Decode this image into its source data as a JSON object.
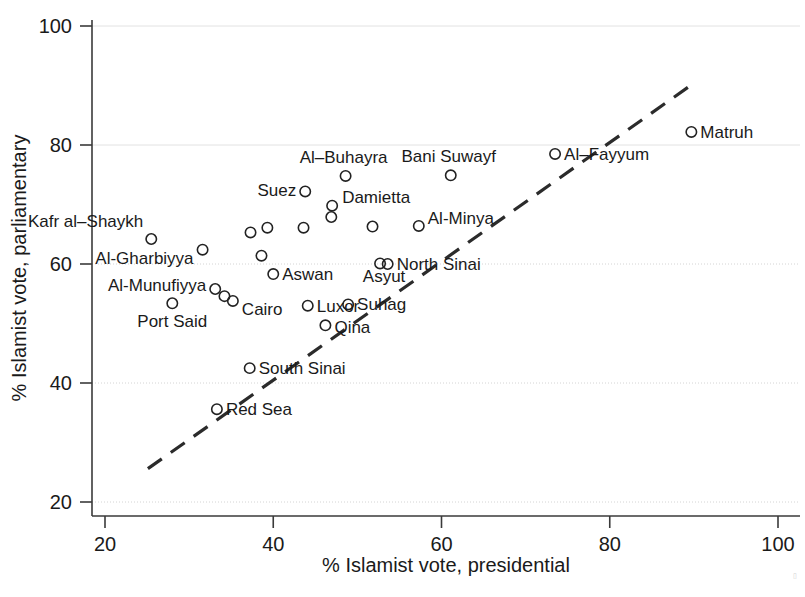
{
  "chart_data": {
    "type": "scatter",
    "title": "",
    "xlabel": "% Islamist vote, presidential",
    "ylabel": "% Islamist vote, parliamentary",
    "xlim": [
      17,
      103
    ],
    "ylim": [
      17.5,
      103
    ],
    "xticks": [
      20,
      40,
      60,
      80,
      100
    ],
    "yticks": [
      20,
      40,
      60,
      80,
      100
    ],
    "xtick_labels": [
      "20",
      "40",
      "60",
      "80",
      "100"
    ],
    "ytick_labels": [
      "20",
      "40",
      "60",
      "80",
      "100"
    ],
    "grid": "horizontal dotted gridlines at each y tick",
    "legend": "none",
    "points": [
      {
        "label": "Kafr al–Shaykh",
        "x": 25.5,
        "y": 64.2,
        "label_dx": -8,
        "label_dy": -12,
        "label_anchor": "end"
      },
      {
        "label": "Port Said",
        "x": 28.0,
        "y": 53.4,
        "label_dx": 0,
        "label_dy": 24,
        "label_anchor": "middle"
      },
      {
        "label": "Al-Gharbiyya",
        "x": 31.6,
        "y": 62.4,
        "label_dx": -9,
        "label_dy": 14,
        "label_anchor": "end"
      },
      {
        "label": "Al-Munufiyya",
        "x": 33.1,
        "y": 55.8,
        "label_dx": -9,
        "label_dy": 2,
        "label_anchor": "end"
      },
      {
        "label": "",
        "x": 34.2,
        "y": 54.6,
        "label_dx": 0,
        "label_dy": 0,
        "label_anchor": "start"
      },
      {
        "label": "Cairo",
        "x": 35.2,
        "y": 53.8,
        "label_dx": 9,
        "label_dy": 14,
        "label_anchor": "start"
      },
      {
        "label": "Red Sea",
        "x": 33.3,
        "y": 35.6,
        "label_dx": 9,
        "label_dy": 6,
        "label_anchor": "start"
      },
      {
        "label": "South Sinai",
        "x": 37.2,
        "y": 42.5,
        "label_dx": 9,
        "label_dy": 6,
        "label_anchor": "start"
      },
      {
        "label": "",
        "x": 37.3,
        "y": 65.3,
        "label_dx": 0,
        "label_dy": 0,
        "label_anchor": "start"
      },
      {
        "label": "",
        "x": 38.6,
        "y": 61.4,
        "label_dx": 0,
        "label_dy": 0,
        "label_anchor": "start"
      },
      {
        "label": "",
        "x": 39.3,
        "y": 66.1,
        "label_dx": 0,
        "label_dy": 0,
        "label_anchor": "start"
      },
      {
        "label": "Aswan",
        "x": 40.0,
        "y": 58.3,
        "label_dx": 9,
        "label_dy": 6,
        "label_anchor": "start"
      },
      {
        "label": "Suez",
        "x": 43.8,
        "y": 72.2,
        "label_dx": -9,
        "label_dy": 5,
        "label_anchor": "end"
      },
      {
        "label": "",
        "x": 43.6,
        "y": 66.1,
        "label_dx": 0,
        "label_dy": 0,
        "label_anchor": "start"
      },
      {
        "label": "Luxor",
        "x": 44.1,
        "y": 53.0,
        "label_dx": 9,
        "label_dy": 6,
        "label_anchor": "start"
      },
      {
        "label": "Qina",
        "x": 46.2,
        "y": 49.7,
        "label_dx": 9,
        "label_dy": 8,
        "label_anchor": "start"
      },
      {
        "label": "Damietta",
        "x": 47.0,
        "y": 69.8,
        "label_dx": 10,
        "label_dy": -3,
        "label_anchor": "start"
      },
      {
        "label": "",
        "x": 46.9,
        "y": 67.9,
        "label_dx": 0,
        "label_dy": 0,
        "label_anchor": "start"
      },
      {
        "label": "Al–Buhayra",
        "x": 48.6,
        "y": 74.8,
        "label_dx": -2,
        "label_dy": -13,
        "label_anchor": "middle"
      },
      {
        "label": "Suhag",
        "x": 48.9,
        "y": 53.2,
        "label_dx": 9,
        "label_dy": 6,
        "label_anchor": "start"
      },
      {
        "label": "",
        "x": 51.8,
        "y": 66.3,
        "label_dx": 0,
        "label_dy": 0,
        "label_anchor": "start"
      },
      {
        "label": "Asyut",
        "x": 52.7,
        "y": 60.1,
        "label_dx": 4,
        "label_dy": 19,
        "label_anchor": "middle"
      },
      {
        "label": "North Sinai",
        "x": 53.6,
        "y": 60.0,
        "label_dx": 9,
        "label_dy": 6,
        "label_anchor": "start"
      },
      {
        "label": "Al-Minya",
        "x": 57.3,
        "y": 66.4,
        "label_dx": 9,
        "label_dy": -2,
        "label_anchor": "start"
      },
      {
        "label": "Bani Suwayf",
        "x": 61.1,
        "y": 74.9,
        "label_dx": -2,
        "label_dy": -13,
        "label_anchor": "middle"
      },
      {
        "label": "Al–Fayyum",
        "x": 73.5,
        "y": 78.5,
        "label_dx": 9,
        "label_dy": 6,
        "label_anchor": "start"
      },
      {
        "label": "Matruh",
        "x": 89.7,
        "y": 82.2,
        "label_dx": 9,
        "label_dy": 6,
        "label_anchor": "start"
      }
    ],
    "fit_line": {
      "style": "dashed",
      "x_start": 25.1,
      "y_start": 25.6,
      "x_end": 89.6,
      "y_end": 90.0
    }
  }
}
